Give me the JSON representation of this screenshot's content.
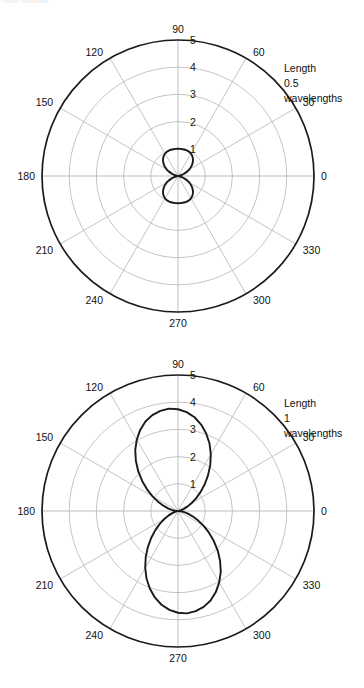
{
  "page": {
    "cropped_header_text": "iliiiiii iiliiiiiiiiiili",
    "width": 364,
    "height": 688
  },
  "geometry": {
    "center_x": 178,
    "outer_radius": 136,
    "radial_max": 5,
    "grid_rings": [
      1,
      2,
      3,
      4
    ],
    "spoke_step_degrees": 30
  },
  "colors": {
    "outer_circle": "#1a1a1a",
    "gridline": "#bdbdbd",
    "curve": "#1a1a1a",
    "text": "#111111",
    "background": "#ffffff"
  },
  "charts": [
    {
      "id": "chart-0",
      "annotation": {
        "line1": "Length",
        "line2": "0.5",
        "line3": "wavelengths"
      },
      "angle_labels": [
        "0",
        "30",
        "60",
        "90",
        "120",
        "150",
        "180",
        "210",
        "240",
        "270",
        "300",
        "330"
      ],
      "radial_labels": [
        "1",
        "2",
        "3",
        "4",
        "5"
      ],
      "chart_data": {
        "type": "line",
        "subtype": "polar",
        "title": "Length 0.5 wavelengths",
        "xlabel": "Angle (degrees)",
        "ylabel": "Relative field strength",
        "rlim": [
          0,
          5
        ],
        "grid": true,
        "legend": "none",
        "theta_labels": [
          0,
          30,
          60,
          90,
          120,
          150,
          180,
          210,
          240,
          270,
          300,
          330
        ],
        "r_ticks": [
          1,
          2,
          3,
          4,
          5
        ],
        "series": [
          {
            "name": "Dipole 0.5 wavelengths",
            "theta": [
              0,
              5,
              10,
              15,
              20,
              25,
              30,
              35,
              40,
              45,
              50,
              55,
              60,
              65,
              70,
              75,
              80,
              85,
              90,
              95,
              100,
              105,
              110,
              115,
              120,
              125,
              130,
              135,
              140,
              145,
              150,
              155,
              160,
              165,
              170,
              175,
              180,
              185,
              190,
              195,
              200,
              205,
              210,
              215,
              220,
              225,
              230,
              235,
              240,
              245,
              250,
              255,
              260,
              265,
              270,
              275,
              280,
              285,
              290,
              295,
              300,
              305,
              310,
              315,
              320,
              325,
              330,
              335,
              340,
              345,
              350,
              355,
              360
            ],
            "r": [
              0.0,
              0.02,
              0.06,
              0.14,
              0.24,
              0.36,
              0.48,
              0.59,
              0.69,
              0.78,
              0.85,
              0.91,
              0.95,
              0.98,
              0.99,
              1.0,
              1.0,
              1.0,
              1.0,
              1.0,
              1.0,
              1.0,
              0.99,
              0.98,
              0.95,
              0.91,
              0.85,
              0.78,
              0.69,
              0.59,
              0.48,
              0.36,
              0.24,
              0.14,
              0.06,
              0.02,
              0.0,
              0.02,
              0.06,
              0.14,
              0.24,
              0.36,
              0.48,
              0.59,
              0.69,
              0.78,
              0.85,
              0.91,
              0.95,
              0.98,
              0.99,
              1.0,
              1.0,
              1.0,
              1.0,
              1.0,
              1.0,
              1.0,
              0.99,
              0.98,
              0.95,
              0.91,
              0.85,
              0.78,
              0.69,
              0.59,
              0.48,
              0.36,
              0.24,
              0.14,
              0.06,
              0.02,
              0.0
            ],
            "peak_r": 1.0,
            "peak_theta": [
              90,
              270
            ],
            "nulls_theta": [
              0,
              180,
              360
            ]
          }
        ]
      }
    },
    {
      "id": "chart-1",
      "annotation": {
        "line1": "Length",
        "line2": "1",
        "line3": "wavelengths"
      },
      "angle_labels": [
        "0",
        "30",
        "60",
        "90",
        "120",
        "150",
        "180",
        "210",
        "240",
        "270",
        "300",
        "330"
      ],
      "radial_labels": [
        "1",
        "2",
        "3",
        "4",
        "5"
      ],
      "chart_data": {
        "type": "line",
        "subtype": "polar",
        "title": "Length 1 wavelengths",
        "xlabel": "Angle (degrees)",
        "ylabel": "Relative field strength",
        "rlim": [
          0,
          5
        ],
        "grid": true,
        "legend": "none",
        "theta_labels": [
          0,
          30,
          60,
          90,
          120,
          150,
          180,
          210,
          240,
          270,
          300,
          330
        ],
        "r_ticks": [
          1,
          2,
          3,
          4,
          5
        ],
        "series": [
          {
            "name": "Dipole 1 wavelength",
            "theta": [
              0,
              5,
              10,
              15,
              20,
              25,
              30,
              35,
              40,
              45,
              50,
              55,
              60,
              65,
              70,
              75,
              80,
              85,
              90,
              95,
              100,
              105,
              110,
              115,
              120,
              125,
              130,
              135,
              140,
              145,
              150,
              155,
              160,
              165,
              170,
              175,
              180,
              185,
              190,
              195,
              200,
              205,
              210,
              215,
              220,
              225,
              230,
              235,
              240,
              245,
              250,
              255,
              260,
              265,
              270,
              275,
              280,
              285,
              290,
              295,
              300,
              305,
              310,
              315,
              320,
              325,
              330,
              335,
              340,
              345,
              350,
              355,
              360
            ],
            "r": [
              0.0,
              0.01,
              0.05,
              0.12,
              0.23,
              0.38,
              0.57,
              0.81,
              1.08,
              1.39,
              1.72,
              2.07,
              2.41,
              2.74,
              3.03,
              3.29,
              3.5,
              3.65,
              3.74,
              3.78,
              3.74,
              3.65,
              3.5,
              3.29,
              3.03,
              2.74,
              2.41,
              2.07,
              1.72,
              1.39,
              1.08,
              0.81,
              0.57,
              0.38,
              0.23,
              0.12,
              0.0,
              0.01,
              0.05,
              0.12,
              0.23,
              0.38,
              0.57,
              0.81,
              1.08,
              1.39,
              1.72,
              2.07,
              2.41,
              2.74,
              3.03,
              3.29,
              3.5,
              3.65,
              3.74,
              3.78,
              3.74,
              3.65,
              3.5,
              3.29,
              3.03,
              2.74,
              2.41,
              2.07,
              1.72,
              1.39,
              1.08,
              0.81,
              0.57,
              0.38,
              0.23,
              0.12,
              0.0
            ],
            "peak_r": 3.78,
            "peak_theta": [
              90,
              270
            ],
            "nulls_theta": [
              0,
              180,
              360
            ]
          }
        ]
      }
    }
  ]
}
